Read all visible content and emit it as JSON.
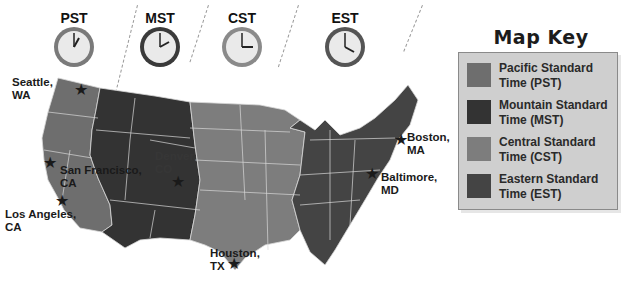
{
  "colors": {
    "pst": "#6e6e6e",
    "mst": "#333333",
    "cst": "#7d7d7d",
    "est": "#444444",
    "border": "#d8d8d8",
    "key_bg": "#cfcfcf"
  },
  "clocks": [
    {
      "label": "PST",
      "hour": 1,
      "minute": 0
    },
    {
      "label": "MST",
      "hour": 2,
      "minute": 0
    },
    {
      "label": "CST",
      "hour": 3,
      "minute": 0
    },
    {
      "label": "EST",
      "hour": 4,
      "minute": 0
    }
  ],
  "cities": [
    {
      "name": "Seattle,",
      "state": "WA"
    },
    {
      "name": "San Francisco,",
      "state": "CA"
    },
    {
      "name": "Los Angeles,",
      "state": "CA"
    },
    {
      "name": "Denver,",
      "state": "CO"
    },
    {
      "name": "Houston,",
      "state": "TX"
    },
    {
      "name": "Boston,",
      "state": "MA"
    },
    {
      "name": "Baltimore,",
      "state": "MD"
    }
  ],
  "map_key": {
    "title": "Map Key",
    "items": [
      {
        "line1": "Pacific Standard",
        "line2": "Time (PST)"
      },
      {
        "line1": "Mountain Standard",
        "line2": "Time (MST)"
      },
      {
        "line1": "Central Standard",
        "line2": "Time (CST)"
      },
      {
        "line1": "Eastern Standard",
        "line2": "Time (EST)"
      }
    ]
  }
}
